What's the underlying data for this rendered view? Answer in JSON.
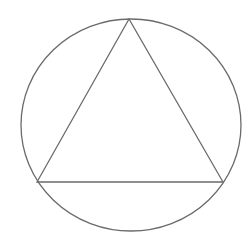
{
  "diagram": {
    "background": "#ffffff",
    "stroke_color": "#6a6a6a",
    "stroke_width": 1.3,
    "circle": {
      "cx": 131,
      "cy": 125,
      "rx": 110,
      "ry": 106
    },
    "triangle": {
      "vertices": [
        {
          "x": 129,
          "y": 19
        },
        {
          "x": 37,
          "y": 182
        },
        {
          "x": 223,
          "y": 182
        }
      ]
    }
  }
}
